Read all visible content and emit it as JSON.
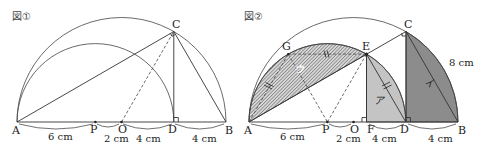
{
  "figure1": {
    "title": "図①",
    "points": {
      "A": "A",
      "P": "P",
      "O": "O",
      "D": "D",
      "B": "B",
      "C": "C"
    },
    "measures": {
      "AP": "6 cm",
      "PO": "2 cm",
      "OD": "4 cm",
      "DB": "4 cm"
    }
  },
  "figure2": {
    "title": "図②",
    "points": {
      "A": "A",
      "P": "P",
      "O": "O",
      "F": "F",
      "D": "D",
      "B": "B",
      "C": "C",
      "E": "E",
      "G": "G"
    },
    "measures": {
      "AP": "6 cm",
      "PO": "2 cm",
      "FD": "4 cm",
      "DB": "4 cm",
      "CB": "8 cm"
    },
    "regions": {
      "a": "ア",
      "i": "イ",
      "u": "ウ"
    },
    "colors": {
      "region_a": "#c4c4c4",
      "region_i": "#8c8c8c",
      "region_u_hatch": "#555555"
    }
  }
}
